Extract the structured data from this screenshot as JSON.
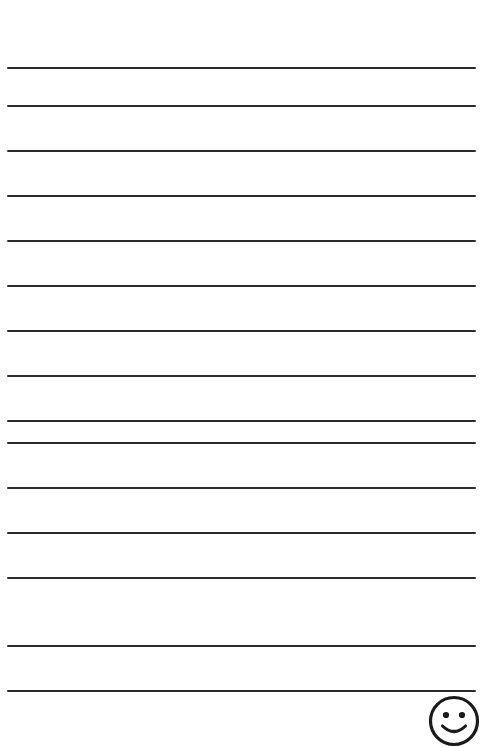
{
  "page": {
    "title": "Lined Notepad Page",
    "width": 499,
    "height": 747,
    "background_color": "#ffffff"
  },
  "ruled_lines": {
    "count": 15,
    "color": "#2b2b2b",
    "thickness_px": 2,
    "left_px": 7,
    "right_px": 476,
    "length_px": 469,
    "spacing_px": 45,
    "first_line_y_px": 67,
    "y_positions": [
      67,
      105,
      150,
      195,
      240,
      285,
      330,
      375,
      420,
      442,
      487,
      532,
      577,
      645,
      690
    ],
    "text": ""
  },
  "smiley_stamp": {
    "name": "smiley-face",
    "center_x_px": 456,
    "center_y_px": 723,
    "radius_px": 24,
    "stroke_color": "#1a1a1a",
    "stroke_width_px": 3,
    "fill_color": "#ffffff",
    "expression": "happy",
    "cropped_at_page_bottom": true,
    "label": "Smiley face stamp"
  },
  "content": {
    "written_text": "",
    "note": ""
  }
}
